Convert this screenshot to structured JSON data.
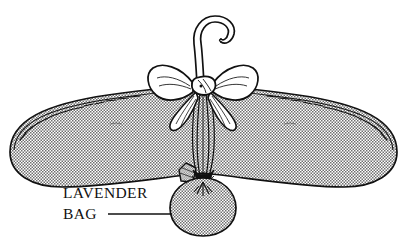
{
  "illustration": {
    "title": "Padded hanger with lavender bag",
    "background_color": "#ffffff",
    "ink_color": "#111111",
    "fill_texture": "halftone-dots",
    "fill_tone_hex": "#9a9a9a"
  },
  "labels": {
    "line1": "LAVENDER",
    "line2": "BAG",
    "leader_line": "——————"
  },
  "parts": {
    "hook": "hanger-hook",
    "bow": "ribbon-bow",
    "bow_knot": "bow-knot",
    "bow_loop_left": "bow-loop-left",
    "bow_loop_right": "bow-loop-right",
    "bow_tail_left": "bow-tail-left",
    "bow_tail_right": "bow-tail-right",
    "body": "padded-hanger-body",
    "stitching": "edge-stitching",
    "ribbon_ties": "ribbon-ties",
    "bag": "lavender-sachet-bag",
    "bag_neck": "bag-gathered-neck",
    "bag_flap": "bag-fabric-flap"
  }
}
